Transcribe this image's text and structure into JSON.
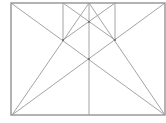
{
  "diagram": {
    "type": "geometric-construction",
    "stroke_color": "#9a9a9a",
    "frame_color": "#8a8a8a",
    "points": {
      "A": [
        11,
        3
      ],
      "B": [
        165,
        3
      ],
      "C": [
        165,
        115
      ],
      "D": [
        12,
        115
      ],
      "T1": [
        63,
        3
      ],
      "T2": [
        89,
        3
      ],
      "T3": [
        115,
        3
      ],
      "B2": [
        89,
        115
      ],
      "P1": [
        63,
        40
      ],
      "P2": [
        115,
        40
      ],
      "P3": [
        89,
        22
      ],
      "P4": [
        89,
        59
      ]
    },
    "segments": [
      [
        "A",
        "C"
      ],
      [
        "D",
        "B"
      ],
      [
        "T1",
        "P1"
      ],
      [
        "T3",
        "P2"
      ],
      [
        "T2",
        "B2"
      ],
      [
        "D",
        "T2"
      ],
      [
        "C",
        "T2"
      ],
      [
        "T1",
        "P2"
      ],
      [
        "T3",
        "P1"
      ]
    ],
    "marked_points": [
      "P1",
      "P2",
      "P3",
      "P4"
    ]
  }
}
